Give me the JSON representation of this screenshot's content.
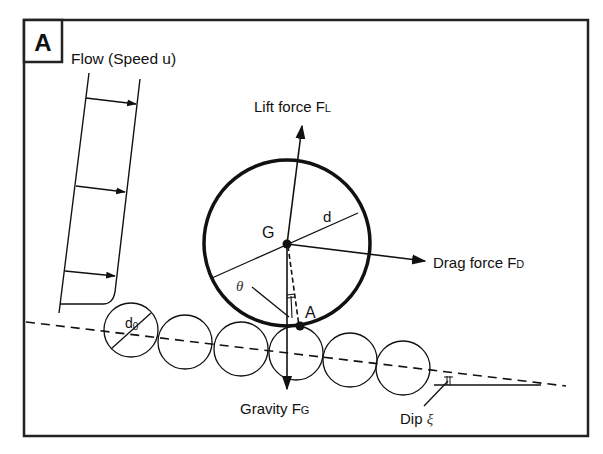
{
  "panel": {
    "label": "A"
  },
  "labels": {
    "flow": "Flow (Speed u)",
    "lift": "Lift force F",
    "lift_sub": "L",
    "drag": "Drag force F",
    "drag_sub": "D",
    "gravity": "Gravity F",
    "gravity_sub": "G",
    "diameter": "d",
    "bead_diameter": "d",
    "bead_diameter_sub": "0",
    "center": "G",
    "contact": "A",
    "theta": "θ",
    "dip": "Dip ",
    "dip_symbol": "ξ"
  },
  "colors": {
    "stroke": "#111111",
    "background": "#ffffff"
  }
}
